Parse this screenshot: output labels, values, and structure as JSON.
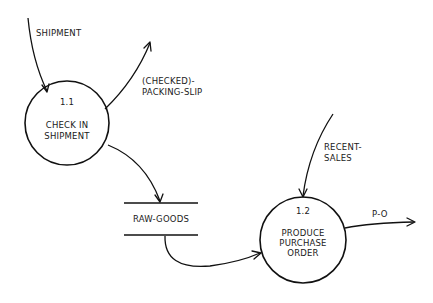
{
  "diagram": {
    "type": "data-flow-diagram",
    "processes": [
      {
        "id": "1.1",
        "name_lines": [
          "CHECK IN",
          "SHIPMENT"
        ]
      },
      {
        "id": "1.2",
        "name_lines": [
          "PRODUCE",
          "PURCHASE",
          "ORDER"
        ]
      }
    ],
    "data_stores": [
      {
        "name": "RAW-GOODS"
      }
    ],
    "flows": [
      {
        "label_lines": [
          "SHIPMENT"
        ],
        "from": "external",
        "to": "1.1"
      },
      {
        "label_lines": [
          "(CHECKED)-",
          "PACKING-SLIP"
        ],
        "from": "1.1",
        "to": "external"
      },
      {
        "label_lines": [],
        "from": "1.1",
        "to": "RAW-GOODS"
      },
      {
        "label_lines": [],
        "from": "RAW-GOODS",
        "to": "1.2"
      },
      {
        "label_lines": [
          "RECENT-",
          "SALES"
        ],
        "from": "external",
        "to": "1.2"
      },
      {
        "label_lines": [
          "P-O"
        ],
        "from": "1.2",
        "to": "external"
      }
    ]
  }
}
